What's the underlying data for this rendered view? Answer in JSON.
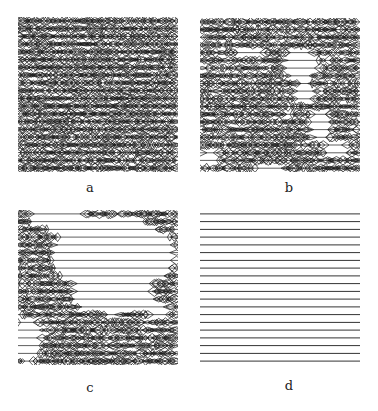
{
  "figure": {
    "panels": [
      {
        "id": "a",
        "label": "a",
        "x": 18,
        "y": 17,
        "w": 160,
        "h": 155,
        "rows": 20,
        "density": 1.0,
        "holes": []
      },
      {
        "id": "b",
        "label": "b",
        "x": 200,
        "y": 18,
        "w": 160,
        "h": 154,
        "rows": 20,
        "density": 0.92,
        "holes": [
          {
            "cx": 50,
            "cy": 34,
            "rx": 14,
            "ry": 4
          },
          {
            "cx": 100,
            "cy": 45,
            "rx": 18,
            "ry": 16
          },
          {
            "cx": 105,
            "cy": 75,
            "rx": 10,
            "ry": 12
          },
          {
            "cx": 120,
            "cy": 108,
            "rx": 12,
            "ry": 16
          },
          {
            "cx": 135,
            "cy": 130,
            "rx": 12,
            "ry": 10
          },
          {
            "cx": 10,
            "cy": 140,
            "rx": 10,
            "ry": 10
          },
          {
            "cx": 70,
            "cy": 150,
            "rx": 14,
            "ry": 4
          }
        ]
      },
      {
        "id": "c",
        "label": "c",
        "x": 18,
        "y": 210,
        "w": 160,
        "h": 155,
        "rows": 20,
        "density": 0.9,
        "holes": [
          {
            "cx": 40,
            "cy": 8,
            "rx": 30,
            "ry": 12
          },
          {
            "cx": 95,
            "cy": 45,
            "rx": 62,
            "ry": 38
          },
          {
            "cx": 95,
            "cy": 85,
            "rx": 42,
            "ry": 20
          },
          {
            "cx": 140,
            "cy": 100,
            "rx": 12,
            "ry": 8
          },
          {
            "cx": 10,
            "cy": 130,
            "rx": 14,
            "ry": 22
          }
        ]
      },
      {
        "id": "d",
        "label": "d",
        "x": 200,
        "y": 210,
        "w": 160,
        "h": 155,
        "rows": 20,
        "density": 0.0,
        "holes": []
      }
    ],
    "label_positions": {
      "a": {
        "x": 80,
        "y": 180
      },
      "b": {
        "x": 279,
        "y": 180
      },
      "c": {
        "x": 80,
        "y": 380
      },
      "d": {
        "x": 279,
        "y": 378
      }
    },
    "colors": {
      "line": "#333333",
      "texture": "#1a1a1a",
      "background": "#ffffff"
    }
  }
}
